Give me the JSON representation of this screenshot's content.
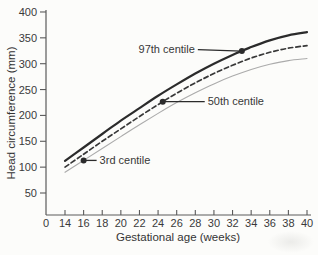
{
  "figure": {
    "background": "#fcfcfa",
    "axis_color": "#5a5a5a",
    "text_color": "#3a3a3a"
  },
  "chart_data": {
    "type": "line",
    "title": "",
    "xlabel": "Gestational age (weeks)",
    "ylabel": "Head circumference (mm)",
    "x": [
      14,
      16,
      18,
      20,
      22,
      24,
      26,
      28,
      30,
      32,
      34,
      36,
      38,
      40
    ],
    "xticks": [
      0,
      14,
      16,
      18,
      20,
      22,
      24,
      26,
      28,
      30,
      32,
      34,
      36,
      38,
      40
    ],
    "yticks": [
      50,
      100,
      150,
      200,
      250,
      300,
      350,
      400
    ],
    "ylim": [
      0,
      400
    ],
    "xlim": [
      0,
      40
    ],
    "grid": false,
    "legend_position": "inline-annotations",
    "series": [
      {
        "name": "97th centile",
        "style": "solid-thick",
        "color": "#2b2b2b",
        "values": [
          112,
          138,
          164,
          190,
          214,
          238,
          260,
          281,
          300,
          317,
          332,
          345,
          355,
          361
        ]
      },
      {
        "name": "50th centile",
        "style": "dashed",
        "color": "#383838",
        "values": [
          100,
          125,
          150,
          174,
          198,
          221,
          243,
          263,
          281,
          297,
          311,
          322,
          330,
          335
        ]
      },
      {
        "name": "3rd centile",
        "style": "solid-thin",
        "color": "#ababab",
        "values": [
          90,
          113,
          136,
          159,
          182,
          204,
          225,
          244,
          261,
          276,
          289,
          299,
          306,
          310
        ]
      }
    ],
    "annotations": [
      {
        "label": "97th centile",
        "series": 0,
        "week": 33,
        "side": "left",
        "leader_px": 44
      },
      {
        "label": "50th centile",
        "series": 1,
        "week": 24.5,
        "side": "right",
        "leader_px": 42
      },
      {
        "label": "3rd centile",
        "series": 2,
        "week": 16,
        "side": "right",
        "leader_px": 13
      }
    ]
  }
}
